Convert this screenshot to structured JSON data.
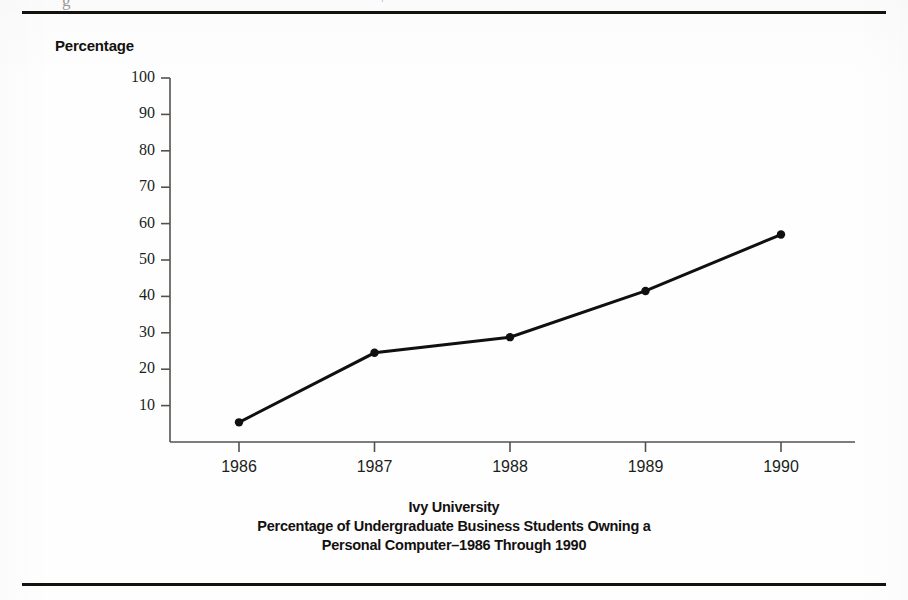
{
  "figure": {
    "y_axis_title": "Percentage",
    "top_cut_glyph": "g",
    "top_cut_glyph_b": "¬",
    "caption_line1": "Ivy University",
    "caption_line2": "Percentage of Undergraduate Business Students Owning a",
    "caption_line3": "Personal Computer–1986 Through 1990",
    "ink_color": "#141210",
    "axis_color": "#55524e",
    "paper_color": "#fefefe"
  },
  "chart_data": {
    "type": "line",
    "title": "Ivy University Percentage of Undergraduate Business Students Owning a Personal Computer–1986 Through 1990",
    "xlabel": "",
    "ylabel": "Percentage",
    "categories": [
      "1986",
      "1987",
      "1988",
      "1989",
      "1990"
    ],
    "values": [
      5.4,
      24.5,
      28.8,
      41.5,
      57.0
    ],
    "ylim": [
      0,
      100
    ],
    "yticks": [
      10,
      20,
      30,
      40,
      50,
      60,
      70,
      80,
      90,
      100
    ],
    "ytick_labels": [
      "10",
      "20",
      "30",
      "40",
      "50",
      "60",
      "70",
      "80",
      "90",
      "100"
    ],
    "xtick_labels": [
      "1986",
      "1987",
      "1988",
      "1989",
      "1990"
    ],
    "grid": false,
    "legend": false,
    "marker": "filled-circle",
    "line_color": "#101010",
    "line_width_px": 3
  }
}
